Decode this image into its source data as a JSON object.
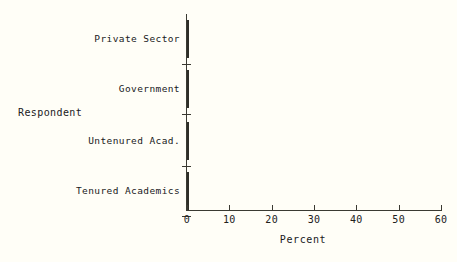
{
  "chart_data": {
    "type": "bar",
    "orientation": "horizontal",
    "title": "",
    "xlabel": "Percent",
    "ylabel": "Respondent",
    "categories": [
      "Private Sector",
      "Government",
      "Untenured Acad.",
      "Tenured Academics"
    ],
    "values": [
      27,
      36,
      42,
      52
    ],
    "xlim": [
      0,
      60
    ],
    "xticks": [
      0,
      10,
      20,
      30,
      40,
      50,
      60
    ],
    "xtick_labels": [
      "0",
      "10",
      "20",
      "30",
      "40",
      "50",
      "60"
    ],
    "grid": false,
    "legend": false,
    "bar_fill": "checkerboard-dither-gray",
    "bar_edge_color": "#2e2e28",
    "background_color": "#fffef7",
    "axis_color": "#3a3a32",
    "note": "Rightmost tick label 60 is clipped by the image edge, rendering as 6"
  },
  "axis": {
    "x_title": "Percent",
    "y_title": "Respondent"
  },
  "bars": [
    {
      "label": "Private Sector",
      "value": 27
    },
    {
      "label": "Government",
      "value": 36
    },
    {
      "label": "Untenured Acad.",
      "value": 42
    },
    {
      "label": "Tenured Academics",
      "value": 52
    }
  ],
  "ticks": [
    {
      "value": 0,
      "label": "0"
    },
    {
      "value": 10,
      "label": "10"
    },
    {
      "value": 20,
      "label": "20"
    },
    {
      "value": 30,
      "label": "30"
    },
    {
      "value": 40,
      "label": "40"
    },
    {
      "value": 50,
      "label": "50"
    },
    {
      "value": 60,
      "label": "60"
    }
  ]
}
